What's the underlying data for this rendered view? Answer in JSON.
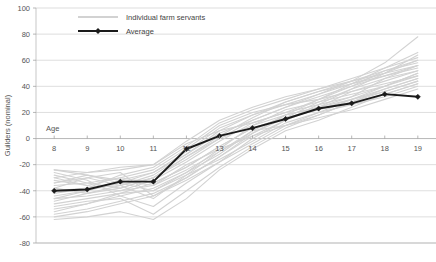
{
  "chart_data": {
    "type": "line",
    "title": "",
    "xlabel": "Age",
    "ylabel": "Guilders (nominal)",
    "xlim": [
      7.45,
      19.55
    ],
    "ylim": [
      -80,
      100
    ],
    "ytick_step": 20,
    "grid": true,
    "x_axis_at_value": 0,
    "legend_position": "top-left-inside",
    "x": [
      8,
      9,
      10,
      11,
      12,
      13,
      14,
      15,
      16,
      17,
      18,
      19
    ],
    "xtick_labels": [
      "8",
      "9",
      "10",
      "11",
      "12",
      "13",
      "14",
      "15",
      "16",
      "17",
      "18",
      "19"
    ],
    "ytick_labels": [
      "100",
      "80",
      "60",
      "40",
      "20",
      "0",
      "-20",
      "-40",
      "-60",
      "-80"
    ],
    "ytick_values": [
      100,
      80,
      60,
      40,
      20,
      0,
      -20,
      -40,
      -60,
      -80
    ],
    "legend": [
      {
        "name": "Individual farm servants",
        "color": "#d2d2d2",
        "marker": "none"
      },
      {
        "name": "Average",
        "color": "#1a1a1a",
        "marker": "diamond"
      }
    ],
    "series": [
      {
        "name": "Average",
        "color": "#1a1a1a",
        "marker": "diamond",
        "values": [
          -40,
          -39,
          -33,
          -33,
          -8,
          2,
          8,
          15,
          23,
          27,
          34,
          32
        ]
      }
    ],
    "individual_series": [
      {
        "name": "servant-1",
        "values": [
          -24,
          -26,
          -22,
          -20,
          -4,
          6,
          12,
          20,
          30,
          40,
          52,
          60
        ]
      },
      {
        "name": "servant-2",
        "values": [
          -46,
          -44,
          -40,
          -36,
          -20,
          -8,
          2,
          14,
          26,
          38,
          50,
          64
        ]
      },
      {
        "name": "servant-3",
        "values": [
          -38,
          -30,
          -26,
          -44,
          -30,
          -14,
          4,
          18,
          24,
          32,
          46,
          56
        ]
      },
      {
        "name": "servant-4",
        "values": [
          -56,
          -50,
          -44,
          -38,
          -26,
          -12,
          6,
          10,
          18,
          28,
          36,
          44
        ]
      },
      {
        "name": "servant-5",
        "values": [
          -62,
          -60,
          -56,
          -62,
          -46,
          -24,
          -8,
          6,
          14,
          24,
          34,
          42
        ]
      },
      {
        "name": "servant-6",
        "values": [
          -28,
          -34,
          -38,
          -30,
          -16,
          0,
          10,
          22,
          28,
          34,
          40,
          48
        ]
      },
      {
        "name": "servant-7",
        "values": [
          -44,
          -40,
          -34,
          -26,
          -10,
          8,
          18,
          26,
          34,
          44,
          58,
          78
        ]
      },
      {
        "name": "servant-8",
        "values": [
          -32,
          -36,
          -30,
          -34,
          -22,
          -6,
          8,
          16,
          22,
          30,
          38,
          46
        ]
      },
      {
        "name": "servant-9",
        "values": [
          -50,
          -46,
          -42,
          -40,
          -28,
          -16,
          -2,
          12,
          20,
          26,
          32,
          40
        ]
      },
      {
        "name": "servant-10",
        "values": [
          -26,
          -32,
          -44,
          -52,
          -34,
          -18,
          0,
          14,
          24,
          36,
          44,
          52
        ]
      },
      {
        "name": "servant-11",
        "values": [
          -40,
          -38,
          -36,
          -28,
          -12,
          4,
          14,
          24,
          32,
          40,
          48,
          56
        ]
      },
      {
        "name": "servant-12",
        "values": [
          -34,
          -28,
          -32,
          -36,
          -24,
          -10,
          6,
          18,
          30,
          42,
          54,
          62
        ]
      },
      {
        "name": "servant-13",
        "values": [
          -58,
          -54,
          -48,
          -42,
          -30,
          -14,
          2,
          10,
          16,
          22,
          30,
          38
        ]
      },
      {
        "name": "servant-14",
        "values": [
          -30,
          -36,
          -40,
          -32,
          -18,
          -2,
          12,
          20,
          26,
          32,
          40,
          50
        ]
      },
      {
        "name": "servant-15",
        "values": [
          -48,
          -42,
          -36,
          -30,
          -14,
          2,
          16,
          28,
          36,
          44,
          52,
          58
        ]
      },
      {
        "name": "servant-16",
        "values": [
          -36,
          -34,
          -30,
          -24,
          -8,
          10,
          20,
          26,
          30,
          36,
          42,
          48
        ]
      },
      {
        "name": "servant-17",
        "values": [
          -52,
          -48,
          -46,
          -58,
          -40,
          -22,
          -6,
          8,
          18,
          28,
          38,
          46
        ]
      },
      {
        "name": "servant-18",
        "values": [
          -42,
          -38,
          -28,
          -22,
          -6,
          12,
          22,
          30,
          38,
          46,
          54,
          66
        ]
      },
      {
        "name": "servant-19",
        "values": [
          -24,
          -28,
          -34,
          -40,
          -26,
          -8,
          10,
          18,
          24,
          30,
          36,
          44
        ]
      },
      {
        "name": "servant-20",
        "values": [
          -60,
          -56,
          -50,
          -44,
          -32,
          -18,
          -4,
          10,
          20,
          30,
          40,
          50
        ]
      },
      {
        "name": "servant-21",
        "values": [
          -38,
          -42,
          -38,
          -30,
          -14,
          0,
          14,
          24,
          34,
          42,
          50,
          60
        ]
      },
      {
        "name": "servant-22",
        "values": [
          -46,
          -40,
          -32,
          -26,
          -12,
          6,
          18,
          28,
          36,
          42,
          48,
          54
        ]
      },
      {
        "name": "servant-23",
        "values": [
          -30,
          -26,
          -24,
          -20,
          -2,
          14,
          24,
          32,
          38,
          44,
          50,
          56
        ]
      },
      {
        "name": "servant-24",
        "values": [
          -54,
          -50,
          -42,
          -34,
          -22,
          -6,
          8,
          16,
          22,
          28,
          34,
          42
        ]
      },
      {
        "name": "servant-25",
        "values": [
          -34,
          -30,
          -36,
          -46,
          -28,
          -10,
          4,
          16,
          28,
          38,
          46,
          52
        ]
      }
    ]
  }
}
